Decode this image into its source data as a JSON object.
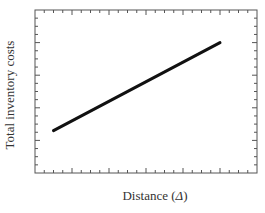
{
  "chart_data": {
    "type": "line",
    "title": "",
    "xlabel": "Distance (Δ)",
    "ylabel": "Total inventory costs",
    "xlabel_prefix": "Distance (",
    "xlabel_symbol": "Δ",
    "xlabel_suffix": ")",
    "x_tick_labels": [],
    "y_tick_labels": [],
    "grid": false,
    "legend": null,
    "xlim": [
      0,
      6
    ],
    "ylim": [
      0,
      5
    ],
    "series": [
      {
        "name": "Total inventory costs",
        "x": [
          0.5,
          5
        ],
        "y": [
          1.3,
          4.0
        ],
        "color": "#111111",
        "line_width": 3
      }
    ],
    "frame": {
      "left": 35,
      "top": 10,
      "right": 257,
      "bottom": 173,
      "major_x_ticks_px": [
        72,
        109,
        146,
        183,
        220
      ],
      "minor_x_tick_step_px": 9.25,
      "major_y_ticks_px": [
        43,
        76,
        108,
        141
      ],
      "minor_y_tick_step_px": 8.15
    }
  },
  "colors": {
    "frame": "#555555",
    "line": "#111111",
    "text": "#333333"
  }
}
